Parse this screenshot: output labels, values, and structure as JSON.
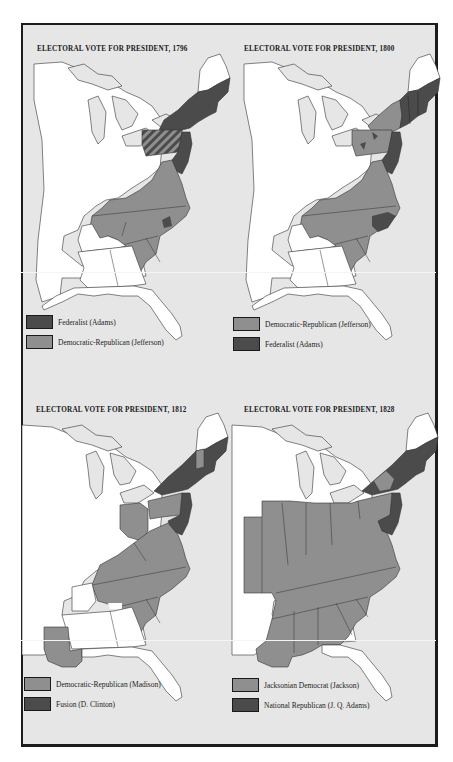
{
  "colors": {
    "background": "#e6e6e6",
    "frame": "#1c1c1c",
    "land_unvoted": "#ffffff",
    "dark_party": "#4b4b4b",
    "light_party": "#8f8f8f",
    "lakes": "#e6e6e6"
  },
  "maps": [
    {
      "title": "ELECTORAL VOTE FOR PRESIDENT, 1796",
      "legend": [
        {
          "label": "Federalist (Adams)",
          "swatch": "dark"
        },
        {
          "label": "Democratic-Republican (Jefferson)",
          "swatch": "light"
        }
      ]
    },
    {
      "title": "ELECTORAL VOTE FOR PRESIDENT, 1800",
      "legend": [
        {
          "label": "Democratic-Republican (Jefferson)",
          "swatch": "light"
        },
        {
          "label": "Federalist (Adams)",
          "swatch": "dark"
        }
      ]
    },
    {
      "title": "ELECTORAL VOTE FOR PRESIDENT, 1812",
      "legend": [
        {
          "label": "Democratic-Republican (Madison)",
          "swatch": "light"
        },
        {
          "label": "Fusion (D. Clinton)",
          "swatch": "dark"
        }
      ]
    },
    {
      "title": "ELECTORAL VOTE FOR PRESIDENT, 1828",
      "legend": [
        {
          "label": "Jacksonian Democrat (Jackson)",
          "swatch": "light"
        },
        {
          "label": "National Republican (J. Q. Adams)",
          "swatch": "dark"
        }
      ]
    }
  ]
}
